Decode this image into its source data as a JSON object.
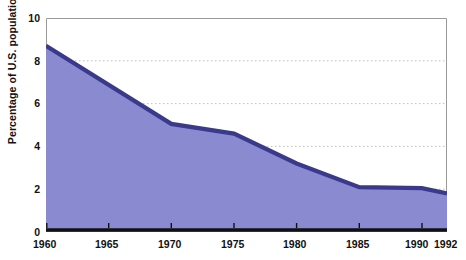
{
  "figure": {
    "clipped_title_remnant": "",
    "background": "#ffffff"
  },
  "axes": {
    "y_title": "Percentage of U.S. population",
    "y_ticks": [
      "10",
      "8",
      "6",
      "4",
      "2",
      "0"
    ],
    "x_ticks": [
      "1960",
      "1965",
      "1970",
      "1975",
      "1980",
      "1985",
      "1990",
      "1992"
    ]
  },
  "colors": {
    "area_fill": "#8A8AD0",
    "area_stroke": "#3A3A8C",
    "axis_line": "#111111",
    "frame_line": "#9a9a9a",
    "gridline": "#c9c9c9",
    "text": "#111111"
  },
  "chart_data": {
    "type": "area",
    "title": "Percentage of U.S. population",
    "xlabel": "",
    "ylabel": "Percentage of U.S. population",
    "xlim": [
      1960,
      1992
    ],
    "ylim": [
      0,
      10
    ],
    "ytick_values": [
      0,
      2,
      4,
      6,
      8,
      10
    ],
    "xtick_values": [
      1960,
      1965,
      1970,
      1975,
      1980,
      1985,
      1990,
      1992
    ],
    "grid": "horizontal-dotted",
    "legend": "none",
    "x": [
      1960,
      1970,
      1975,
      1980,
      1985,
      1990,
      1992
    ],
    "values": [
      8.7,
      5.05,
      4.6,
      3.2,
      2.1,
      2.05,
      1.8
    ],
    "series": [
      {
        "name": "Percentage of U.S. population",
        "points": [
          {
            "x": 1960,
            "y": 8.7
          },
          {
            "x": 1970,
            "y": 5.05
          },
          {
            "x": 1975,
            "y": 4.6
          },
          {
            "x": 1980,
            "y": 3.2
          },
          {
            "x": 1985,
            "y": 2.1
          },
          {
            "x": 1990,
            "y": 2.05
          },
          {
            "x": 1992,
            "y": 1.8
          }
        ]
      }
    ]
  }
}
